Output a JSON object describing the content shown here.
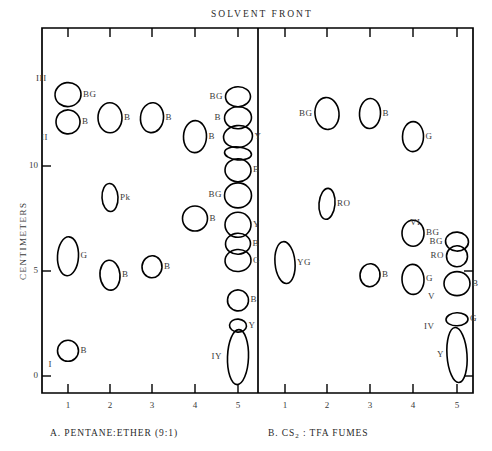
{
  "figure": {
    "top_label": "SOLVENT FRONT",
    "y_axis_label": "CENTIMETERS",
    "y_ticks": [
      "0",
      "5",
      "10"
    ],
    "x_ticks": [
      "1",
      "2",
      "3",
      "4",
      "5"
    ]
  },
  "panels": [
    {
      "id": "panel-a",
      "caption": "A. PENTANE:ETHER (9:1)",
      "lane_labels": [
        "1",
        "2",
        "3",
        "4",
        "5"
      ]
    },
    {
      "id": "panel-b",
      "caption": "B. CS₂ : TFA FUMES",
      "lane_labels": [
        "1",
        "2",
        "3",
        "4",
        "5"
      ]
    }
  ],
  "chart_data": {
    "type": "scatter",
    "title": "SOLVENT FRONT",
    "xlabel": "",
    "ylabel": "CENTIMETERS",
    "ylim": [
      -1.2,
      15.2
    ],
    "y_ticks": [
      0,
      5,
      10
    ],
    "x_ticks": [
      1,
      2,
      3,
      4,
      5
    ],
    "grid": false,
    "legend": "none",
    "panels": [
      {
        "name": "A. PENTANE:ETHER (9:1)",
        "spots": [
          {
            "lane": 1,
            "cm": 13.4,
            "label": "BG",
            "side": "right",
            "w": 26,
            "h": 24
          },
          {
            "lane": 1,
            "cm": 12.1,
            "label": "B",
            "side": "right",
            "w": 24,
            "h": 24,
            "band": "II"
          },
          {
            "lane": 1,
            "cm": 5.7,
            "label": "G",
            "side": "right",
            "w": 21,
            "h": 39
          },
          {
            "lane": 1,
            "cm": 1.2,
            "label": "B",
            "side": "right",
            "w": 21,
            "h": 21,
            "band": "I"
          },
          {
            "lane": 2,
            "cm": 12.3,
            "label": "B",
            "side": "right",
            "w": 24,
            "h": 30
          },
          {
            "lane": 2,
            "cm": 8.5,
            "label": "Pk",
            "side": "right",
            "w": 16,
            "h": 28
          },
          {
            "lane": 2,
            "cm": 4.8,
            "label": "B",
            "side": "right",
            "w": 20,
            "h": 30
          },
          {
            "lane": 3,
            "cm": 12.3,
            "label": "B",
            "side": "right",
            "w": 23,
            "h": 30
          },
          {
            "lane": 3,
            "cm": 5.2,
            "label": "B",
            "side": "right",
            "w": 20,
            "h": 22
          },
          {
            "lane": 4,
            "cm": 11.4,
            "label": "B",
            "side": "right",
            "w": 23,
            "h": 32
          },
          {
            "lane": 4,
            "cm": 7.5,
            "label": "B",
            "side": "right",
            "w": 25,
            "h": 25
          },
          {
            "lane": 5,
            "cm": 13.3,
            "label": "BG",
            "side": "left",
            "w": 25,
            "h": 20
          },
          {
            "lane": 5,
            "cm": 12.3,
            "label": "B",
            "side": "left",
            "w": 27,
            "h": 22
          },
          {
            "lane": 5,
            "cm": 11.4,
            "label": "Y",
            "side": "right",
            "w": 29,
            "h": 22
          },
          {
            "lane": 5,
            "cm": 10.6,
            "label": "",
            "side": "right",
            "w": 27,
            "h": 13
          },
          {
            "lane": 5,
            "cm": 9.8,
            "label": "B",
            "side": "right",
            "w": 26,
            "h": 23
          },
          {
            "lane": 5,
            "cm": 8.6,
            "label": "BG",
            "side": "left",
            "w": 27,
            "h": 25
          },
          {
            "lane": 5,
            "cm": 7.2,
            "label": "Y",
            "side": "right",
            "w": 26,
            "h": 25
          },
          {
            "lane": 5,
            "cm": 6.3,
            "label": "B",
            "side": "right",
            "w": 25,
            "h": 21
          },
          {
            "lane": 5,
            "cm": 5.5,
            "label": "G",
            "side": "right",
            "w": 26,
            "h": 22
          },
          {
            "lane": 5,
            "cm": 3.6,
            "label": "B",
            "side": "right",
            "w": 21,
            "h": 21
          },
          {
            "lane": 5,
            "cm": 2.4,
            "label": "Y",
            "side": "right",
            "w": 17,
            "h": 13
          },
          {
            "lane": 5,
            "cm": 0.9,
            "label": "IY",
            "side": "left",
            "w": 21,
            "h": 55
          }
        ]
      },
      {
        "name": "B. CS2 : TFA FUMES",
        "spots": [
          {
            "lane": 2,
            "cm": 12.5,
            "label": "BG",
            "side": "left",
            "w": 24,
            "h": 32
          },
          {
            "lane": 2,
            "cm": 8.2,
            "label": "RO",
            "side": "right",
            "w": 16,
            "h": 31
          },
          {
            "lane": 3,
            "cm": 12.5,
            "label": "B",
            "side": "right",
            "w": 21,
            "h": 30
          },
          {
            "lane": 4,
            "cm": 11.4,
            "label": "G",
            "side": "right",
            "w": 21,
            "h": 30
          },
          {
            "lane": 4,
            "cm": 6.8,
            "label": "BG",
            "side": "right",
            "w": 22,
            "h": 26
          },
          {
            "lane": 4,
            "cm": 4.6,
            "label": "G",
            "side": "right",
            "w": 22,
            "h": 30
          },
          {
            "lane": 1,
            "cm": 5.4,
            "label": "YG",
            "side": "right",
            "w": 20,
            "h": 42
          },
          {
            "lane": 3,
            "cm": 4.8,
            "label": "B",
            "side": "right",
            "w": 20,
            "h": 23
          },
          {
            "lane": 5,
            "cm": 6.4,
            "label": "BG",
            "side": "left",
            "w": 23,
            "h": 19,
            "band": ""
          },
          {
            "lane": 5,
            "cm": 5.7,
            "label": "RO",
            "side": "left",
            "w": 21,
            "h": 21
          },
          {
            "lane": 5,
            "cm": 4.4,
            "label": "B",
            "side": "right",
            "w": 26,
            "h": 24,
            "band": "V"
          },
          {
            "lane": 5,
            "cm": 2.7,
            "label": "G",
            "side": "right",
            "w": 22,
            "h": 13,
            "band": "IV"
          },
          {
            "lane": 5,
            "cm": 1.0,
            "label": "Y",
            "side": "left",
            "w": 20,
            "h": 55
          }
        ],
        "band_labels": [
          "VI",
          "V",
          "IV"
        ]
      }
    ]
  }
}
